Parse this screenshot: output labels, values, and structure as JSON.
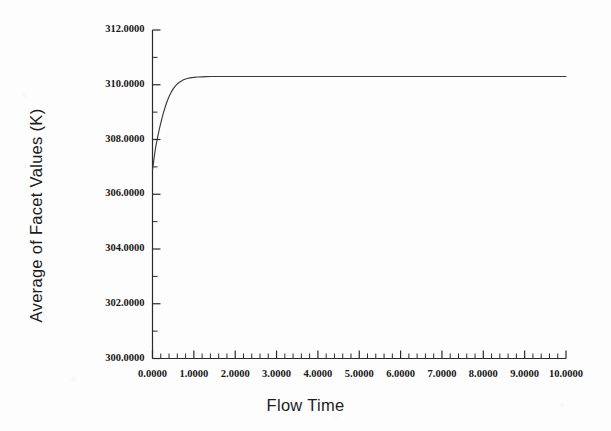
{
  "chart_data": {
    "type": "line",
    "title": "",
    "xlabel": "Flow Time",
    "ylabel": "Average of Facet Values (K)",
    "xlim": [
      0.0,
      10.0
    ],
    "ylim": [
      300.0,
      312.0
    ],
    "xticks": [
      0.0,
      1.0,
      2.0,
      3.0,
      4.0,
      5.0,
      6.0,
      7.0,
      8.0,
      9.0,
      10.0
    ],
    "xtick_labels": [
      "0.0000",
      "1.0000",
      "2.0000",
      "3.0000",
      "4.0000",
      "5.0000",
      "6.0000",
      "7.0000",
      "8.0000",
      "9.0000",
      "10.0000"
    ],
    "yticks": [
      300.0,
      302.0,
      304.0,
      306.0,
      308.0,
      310.0,
      312.0
    ],
    "ytick_labels": [
      "300.0000",
      "302.0000",
      "304.0000",
      "306.0000",
      "308.0000",
      "310.0000",
      "312.0000"
    ],
    "x_minor_per_major": 5,
    "y_minor_per_major": 2,
    "grid": false,
    "legend": false,
    "line_color": "#3a3a3a",
    "series": [
      {
        "name": "Average of Facet Values",
        "x": [
          0.0,
          0.02,
          0.05,
          0.08,
          0.12,
          0.16,
          0.2,
          0.25,
          0.3,
          0.35,
          0.4,
          0.45,
          0.5,
          0.55,
          0.6,
          0.65,
          0.7,
          0.75,
          0.8,
          0.85,
          0.9,
          0.95,
          1.0,
          1.1,
          1.2,
          1.3,
          1.4,
          1.5,
          1.75,
          2.0,
          2.5,
          3.0,
          3.5,
          4.0,
          4.5,
          5.0,
          5.5,
          6.0,
          6.5,
          7.0,
          7.5,
          8.0,
          8.5,
          9.0,
          9.5,
          10.0
        ],
        "y": [
          306.9,
          307.1,
          307.45,
          307.75,
          308.05,
          308.35,
          308.6,
          308.9,
          309.15,
          309.38,
          309.57,
          309.72,
          309.85,
          309.95,
          310.03,
          310.09,
          310.14,
          310.18,
          310.21,
          310.23,
          310.25,
          310.26,
          310.27,
          310.285,
          310.29,
          310.295,
          310.3,
          310.3,
          310.3,
          310.3,
          310.3,
          310.3,
          310.3,
          310.3,
          310.3,
          310.3,
          310.3,
          310.3,
          310.3,
          310.3,
          310.3,
          310.3,
          310.3,
          310.3,
          310.3,
          310.3
        ]
      }
    ],
    "annotations": {
      "initial_value": 306.9,
      "plateau_value": 310.3,
      "rise_complete_at_x": 1.2
    }
  },
  "figure": {
    "background_color": "#fdfdfd",
    "axis_color": "#2a2a2a"
  }
}
